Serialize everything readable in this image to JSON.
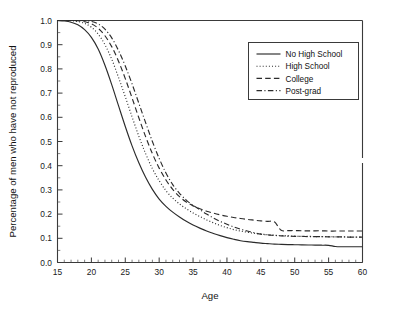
{
  "chart_data": {
    "type": "line",
    "title": "",
    "xlabel": "Age",
    "ylabel": "Percentage of men who have not reproduced",
    "xlim": [
      15,
      60
    ],
    "ylim": [
      0.0,
      1.0
    ],
    "xticks": [
      15,
      20,
      25,
      30,
      35,
      40,
      45,
      50,
      55,
      60
    ],
    "xtick_labels": [
      "15",
      "20",
      "25",
      "30",
      "35",
      "40",
      "45",
      "50",
      "55",
      "60"
    ],
    "x_minor_tick_step": 1,
    "yticks": [
      0.0,
      0.1,
      0.2,
      0.3,
      0.4,
      0.5,
      0.6,
      0.7,
      0.8,
      0.9,
      1.0
    ],
    "ytick_labels": [
      "0.0",
      "0.1",
      "0.2",
      "0.3",
      "0.4",
      "0.5",
      "0.6",
      "0.7",
      "0.8",
      "0.9",
      "1.0"
    ],
    "y_minor_tick_step": 0.05,
    "grid": false,
    "legend_position": "upper right",
    "line_color": "#2b2b2b",
    "axis_color": "#3a3a3a",
    "background": "#ffffff",
    "x": [
      15,
      16,
      17,
      18,
      19,
      20,
      21,
      22,
      23,
      24,
      25,
      26,
      27,
      28,
      29,
      30,
      31,
      32,
      33,
      34,
      35,
      36,
      37,
      38,
      39,
      40,
      41,
      42,
      43,
      44,
      45,
      46,
      47,
      48,
      49,
      50,
      51,
      52,
      53,
      54,
      55,
      56,
      57,
      58,
      59,
      60
    ],
    "series": [
      {
        "name": "No High School",
        "dash": "solid",
        "values": [
          1.0,
          0.998,
          0.993,
          0.982,
          0.962,
          0.93,
          0.882,
          0.815,
          0.735,
          0.648,
          0.562,
          0.482,
          0.412,
          0.352,
          0.302,
          0.262,
          0.232,
          0.208,
          0.188,
          0.17,
          0.155,
          0.142,
          0.13,
          0.12,
          0.111,
          0.103,
          0.096,
          0.09,
          0.086,
          0.083,
          0.08,
          0.078,
          0.076,
          0.075,
          0.074,
          0.0735,
          0.073,
          0.0725,
          0.072,
          0.0715,
          0.071,
          0.066,
          0.065,
          0.065,
          0.065,
          0.065
        ]
      },
      {
        "name": "High School",
        "dash": "dotted",
        "values": [
          1.0,
          1.0,
          0.999,
          0.996,
          0.988,
          0.972,
          0.944,
          0.9,
          0.84,
          0.765,
          0.685,
          0.602,
          0.522,
          0.45,
          0.388,
          0.338,
          0.297,
          0.266,
          0.242,
          0.222,
          0.205,
          0.19,
          0.176,
          0.164,
          0.153,
          0.144,
          0.136,
          0.13,
          0.125,
          0.121,
          0.118,
          0.115,
          0.113,
          0.111,
          0.11,
          0.109,
          0.108,
          0.108,
          0.107,
          0.107,
          0.107,
          0.106,
          0.106,
          0.105,
          0.105,
          0.105
        ]
      },
      {
        "name": "College",
        "dash": "dashed",
        "values": [
          1.0,
          1.0,
          1.0,
          0.999,
          0.995,
          0.986,
          0.968,
          0.937,
          0.892,
          0.832,
          0.76,
          0.68,
          0.598,
          0.52,
          0.45,
          0.39,
          0.341,
          0.302,
          0.272,
          0.25,
          0.234,
          0.222,
          0.212,
          0.204,
          0.197,
          0.191,
          0.186,
          0.182,
          0.178,
          0.175,
          0.172,
          0.17,
          0.168,
          0.133,
          0.132,
          0.132,
          0.131,
          0.131,
          0.131,
          0.131,
          0.13,
          0.13,
          0.13,
          0.13,
          0.13,
          0.13
        ]
      },
      {
        "name": "Post-grad",
        "dash": "dashdot",
        "values": [
          1.0,
          1.0,
          1.0,
          1.0,
          0.999,
          0.996,
          0.986,
          0.964,
          0.928,
          0.876,
          0.812,
          0.738,
          0.658,
          0.578,
          0.5,
          0.43,
          0.37,
          0.322,
          0.286,
          0.258,
          0.236,
          0.218,
          0.2,
          0.184,
          0.17,
          0.158,
          0.147,
          0.138,
          0.13,
          0.123,
          0.117,
          0.114,
          0.112,
          0.11,
          0.109,
          0.108,
          0.108,
          0.107,
          0.107,
          0.107,
          0.106,
          0.106,
          0.106,
          0.105,
          0.105,
          0.105
        ]
      }
    ],
    "legend_entries": [
      {
        "label": "No High School",
        "dash": "solid"
      },
      {
        "label": "High School",
        "dash": "dotted"
      },
      {
        "label": "College",
        "dash": "dashed"
      },
      {
        "label": "Post-grad",
        "dash": "dashdot"
      }
    ]
  }
}
